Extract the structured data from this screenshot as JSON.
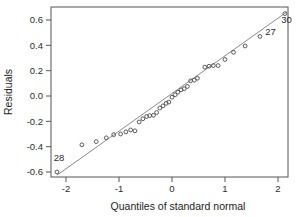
{
  "chart_data": {
    "type": "scatter",
    "title": "",
    "xlabel": "Quantiles of standard normal",
    "ylabel": "Residuals",
    "xlim": [
      -2.35,
      2.35
    ],
    "ylim": [
      -0.7,
      0.7
    ],
    "xticks": [
      -2,
      -1,
      0,
      1,
      2
    ],
    "xtick_labels": [
      "-2",
      "-1",
      "0",
      "1",
      "2"
    ],
    "yticks": [
      0.6,
      0.4,
      0.2,
      0.0,
      -0.2,
      -0.4,
      -0.6
    ],
    "ytick_labels": [
      "0.6",
      "0.4",
      "0.2",
      "0.0",
      "-0.2",
      "-0.4",
      "-0.6"
    ],
    "grid": false,
    "legend": "none",
    "frame": "box",
    "reference_line": {
      "x": [
        -2.17,
        2.17
      ],
      "y": [
        -0.625,
        0.665
      ],
      "color": "#8a8a8a"
    },
    "series": [
      {
        "name": "residual quantiles",
        "marker": "open-circle",
        "color": "#4a4a4a",
        "points": [
          {
            "x": -2.17,
            "y": -0.6,
            "label": "28"
          },
          {
            "x": -1.7,
            "y": -0.385,
            "label": ""
          },
          {
            "x": -1.43,
            "y": -0.36,
            "label": ""
          },
          {
            "x": -1.24,
            "y": -0.33,
            "label": ""
          },
          {
            "x": -1.1,
            "y": -0.305,
            "label": ""
          },
          {
            "x": -0.97,
            "y": -0.3,
            "label": ""
          },
          {
            "x": -0.87,
            "y": -0.283,
            "label": ""
          },
          {
            "x": -0.78,
            "y": -0.268,
            "label": ""
          },
          {
            "x": -0.7,
            "y": -0.275,
            "label": ""
          },
          {
            "x": -0.62,
            "y": -0.205,
            "label": ""
          },
          {
            "x": -0.55,
            "y": -0.18,
            "label": ""
          },
          {
            "x": -0.48,
            "y": -0.162,
            "label": ""
          },
          {
            "x": -0.42,
            "y": -0.155,
            "label": ""
          },
          {
            "x": -0.35,
            "y": -0.152,
            "label": ""
          },
          {
            "x": -0.29,
            "y": -0.13,
            "label": ""
          },
          {
            "x": -0.23,
            "y": -0.095,
            "label": ""
          },
          {
            "x": -0.17,
            "y": -0.078,
            "label": ""
          },
          {
            "x": -0.11,
            "y": -0.058,
            "label": ""
          },
          {
            "x": -0.06,
            "y": -0.048,
            "label": ""
          },
          {
            "x": 0.0,
            "y": -0.01,
            "label": ""
          },
          {
            "x": 0.06,
            "y": 0.01,
            "label": ""
          },
          {
            "x": 0.11,
            "y": 0.03,
            "label": ""
          },
          {
            "x": 0.17,
            "y": 0.048,
            "label": ""
          },
          {
            "x": 0.23,
            "y": 0.058,
            "label": ""
          },
          {
            "x": 0.29,
            "y": 0.075,
            "label": ""
          },
          {
            "x": 0.35,
            "y": 0.12,
            "label": ""
          },
          {
            "x": 0.42,
            "y": 0.125,
            "label": ""
          },
          {
            "x": 0.48,
            "y": 0.14,
            "label": ""
          },
          {
            "x": 0.62,
            "y": 0.228,
            "label": ""
          },
          {
            "x": 0.7,
            "y": 0.235,
            "label": ""
          },
          {
            "x": 0.78,
            "y": 0.24,
            "label": ""
          },
          {
            "x": 0.87,
            "y": 0.24,
            "label": ""
          },
          {
            "x": 1.0,
            "y": 0.288,
            "label": ""
          },
          {
            "x": 1.16,
            "y": 0.345,
            "label": ""
          },
          {
            "x": 1.38,
            "y": 0.395,
            "label": ""
          },
          {
            "x": 1.66,
            "y": 0.47,
            "label": "27"
          },
          {
            "x": 2.13,
            "y": 0.65,
            "label": "30"
          }
        ]
      }
    ],
    "annotations": [
      {
        "text": "28",
        "x": -2.13,
        "y": -0.515,
        "anchor": "middle"
      },
      {
        "text": "27",
        "x": 1.76,
        "y": 0.478,
        "anchor": "start"
      },
      {
        "text": "30",
        "x": 2.16,
        "y": 0.578,
        "anchor": "middle"
      }
    ]
  }
}
